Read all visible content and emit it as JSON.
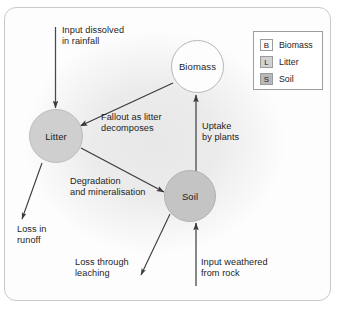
{
  "figure": {
    "type": "nutrient-cycling-diagram",
    "frame": {
      "border_color": "#c9c9c9",
      "background": "#fdfdfd"
    }
  },
  "nodes": [
    {
      "id": "biomass",
      "label": "Biomass",
      "fill": "#fdfdfd",
      "stroke": "#b6b6b6"
    },
    {
      "id": "litter",
      "label": "Litter",
      "fill": "#cfcfcf",
      "stroke": "#bdbdbd"
    },
    {
      "id": "soil",
      "label": "Soil",
      "fill": "#c4c4c4",
      "stroke": "#b2b2b2"
    }
  ],
  "flows": [
    {
      "id": "input-rainfall",
      "label": "Input dissolved\nin rainfall",
      "from": "external",
      "to": "litter"
    },
    {
      "id": "fallout",
      "label": "Fallout as litter\ndecomposes",
      "from": "biomass",
      "to": "litter"
    },
    {
      "id": "uptake",
      "label": "Uptake\nby plants",
      "from": "soil",
      "to": "biomass"
    },
    {
      "id": "degradation",
      "label": "Degradation\nand mineralisation",
      "from": "litter",
      "to": "soil"
    },
    {
      "id": "loss-runoff",
      "label": "Loss in\nrunoff",
      "from": "litter",
      "to": "external"
    },
    {
      "id": "loss-leaching",
      "label": "Loss through\nleaching",
      "from": "soil",
      "to": "external"
    },
    {
      "id": "input-rock",
      "label": "Input weathered\nfrom rock",
      "from": "external",
      "to": "soil"
    }
  ],
  "legend": {
    "items": [
      {
        "key": "B",
        "label": "Biomass",
        "swatch_color": "#fbfbfb"
      },
      {
        "key": "L",
        "label": "Litter",
        "swatch_color": "#d2d2d2"
      },
      {
        "key": "S",
        "label": "Soil",
        "swatch_color": "#b9b9b9"
      }
    ]
  },
  "caption": {
    "text": ""
  }
}
